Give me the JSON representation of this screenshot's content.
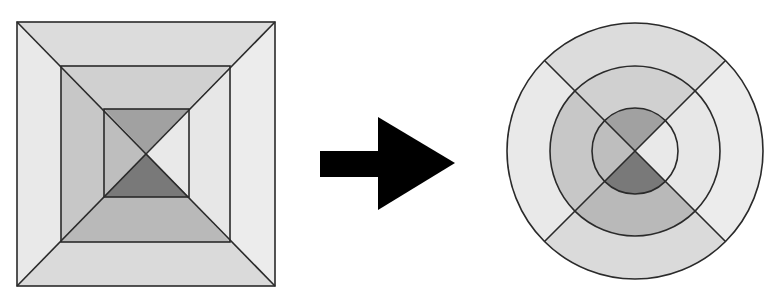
{
  "diagram": {
    "left_figure": {
      "shape": "square",
      "center": [
        146,
        153
      ],
      "rings": [
        {
          "name": "outer",
          "x1": 17,
          "y1": 22,
          "x2": 275,
          "y2": 286,
          "colors": {
            "top": "#dcdcdc",
            "right": "#ececec",
            "bottom": "#dadada",
            "left": "#e9e9e9"
          }
        },
        {
          "name": "middle",
          "x1": 61,
          "y1": 66,
          "x2": 230,
          "y2": 242,
          "colors": {
            "top": "#d0d0d0",
            "right": "#e7e7e7",
            "bottom": "#b9b9b9",
            "left": "#c7c7c7"
          }
        },
        {
          "name": "inner",
          "x1": 104,
          "y1": 109,
          "x2": 189,
          "y2": 197,
          "colors": {
            "top": "#a1a1a1",
            "right": "#e9e9e9",
            "bottom": "#797979",
            "left": "#bebebe"
          }
        }
      ]
    },
    "arrow": {
      "direction": "right",
      "color": "#000000",
      "shaft": {
        "x1": 320,
        "y1": 151,
        "x2": 379,
        "y2": 177
      },
      "head": {
        "base_x": 378,
        "top_y": 117,
        "bottom_y": 210,
        "tip_x": 455,
        "tip_y": 163
      }
    },
    "right_figure": {
      "shape": "circle",
      "center": [
        635,
        151
      ],
      "rings": [
        {
          "name": "outer",
          "r": 128,
          "colors": {
            "top": "#dcdcdc",
            "right": "#ececec",
            "bottom": "#dadada",
            "left": "#e9e9e9"
          }
        },
        {
          "name": "middle",
          "r": 85,
          "colors": {
            "top": "#d0d0d0",
            "right": "#e7e7e7",
            "bottom": "#b9b9b9",
            "left": "#c7c7c7"
          }
        },
        {
          "name": "inner",
          "r": 43,
          "colors": {
            "top": "#a1a1a1",
            "right": "#e9e9e9",
            "bottom": "#797979",
            "left": "#bebebe"
          }
        }
      ]
    },
    "line_color": "#2a2a2a"
  }
}
